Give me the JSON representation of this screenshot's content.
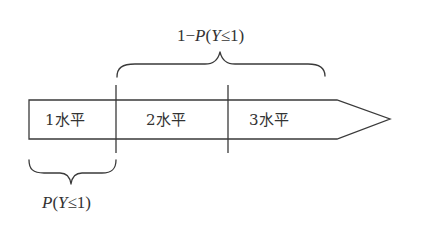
{
  "diagram": {
    "type": "ordinal-scale-arrow",
    "segments": [
      {
        "label": "1水平"
      },
      {
        "label": "2水平"
      },
      {
        "label": "3水平"
      }
    ],
    "top_brace": {
      "prefix": "1−",
      "P": "P",
      "open": "(",
      "Y": "Y",
      "rel": "≤1)",
      "full_text": "1−P(Y≤1)",
      "spans": "2水平–3水平"
    },
    "bottom_brace": {
      "P": "P",
      "open": "(",
      "Y": "Y",
      "rel": "≤1)",
      "full_text": "P(Y≤1)",
      "spans": "1水平"
    },
    "colors": {
      "stroke": "#3a3a3a",
      "text": "#333333",
      "background": "#ffffff"
    }
  }
}
